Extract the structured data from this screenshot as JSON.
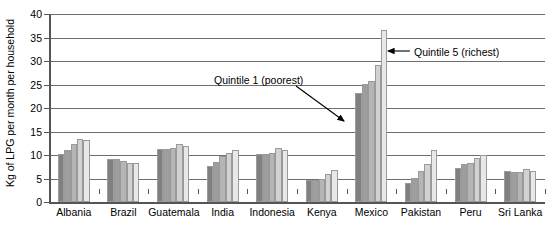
{
  "chart_data": {
    "type": "bar",
    "title": "",
    "xlabel": "",
    "ylabel": "Kg of LPG per month per household",
    "ylim": [
      0,
      40
    ],
    "ytick_step": 5,
    "yticks": [
      0,
      5,
      10,
      15,
      20,
      25,
      30,
      35,
      40
    ],
    "grid": "horizontal",
    "legend_position": "none",
    "categories": [
      "Albania",
      "Brazil",
      "Guatemala",
      "India",
      "Indonesia",
      "Kenya",
      "Mexico",
      "Pakistan",
      "Peru",
      "Sri Lanka"
    ],
    "series": [
      {
        "name": "Quintile 1 (poorest)",
        "color": "#808080",
        "values": [
          10.3,
          9.2,
          11.2,
          7.6,
          10.2,
          4.6,
          23.2,
          4.0,
          7.2,
          6.5
        ]
      },
      {
        "name": "Quintile 2",
        "color": "#9e9e9e",
        "values": [
          11.0,
          9.2,
          11.3,
          8.6,
          10.3,
          4.6,
          25.2,
          5.2,
          8.0,
          6.3
        ]
      },
      {
        "name": "Quintile 3",
        "color": "#b5b5b5",
        "values": [
          12.4,
          8.8,
          11.4,
          9.7,
          10.5,
          5.0,
          25.8,
          6.6,
          8.2,
          6.3
        ]
      },
      {
        "name": "Quintile 4",
        "color": "#d2d2d2",
        "values": [
          13.4,
          8.4,
          12.4,
          10.5,
          11.5,
          6.0,
          29.1,
          8.0,
          9.3,
          7.0
        ]
      },
      {
        "name": "Quintile 5 (richest)",
        "color": "#e8e8e8",
        "values": [
          13.1,
          8.2,
          11.9,
          11.1,
          11.0,
          6.8,
          36.5,
          11.0,
          10.0,
          6.6
        ]
      }
    ],
    "annotations": [
      {
        "id": "quintile-1",
        "text": "Quintile 1 (poorest)",
        "points_to": "Mexico Quintile 1 bar"
      },
      {
        "id": "quintile-5",
        "text": "Quintile 5 (richest)",
        "points_to": "Mexico Quintile 5 bar"
      }
    ]
  }
}
